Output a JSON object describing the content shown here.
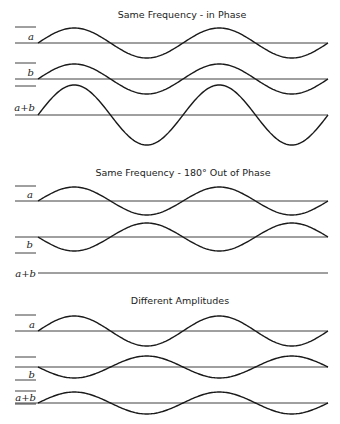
{
  "sections": [
    {
      "title": "Same Frequency - in Phase",
      "rows": [
        {
          "label": "a",
          "baseline": 43,
          "amplitude": 15,
          "phase": 0
        },
        {
          "label": "b",
          "baseline": 79,
          "amplitude": 15,
          "phase": 0
        },
        {
          "label": "a+b",
          "baseline": 115,
          "amplitude": 30,
          "phase": 0
        }
      ]
    },
    {
      "title": "Same Frequency - 180° Out of Phase",
      "rows": [
        {
          "label": "a",
          "baseline": 201,
          "amplitude": 14,
          "phase": 0
        },
        {
          "label": "b",
          "baseline": 237,
          "amplitude": 14,
          "phase": 180
        },
        {
          "label": "a+b",
          "baseline": 273,
          "amplitude": 0,
          "phase": 0
        }
      ]
    },
    {
      "title": "Different Amplitudes",
      "rows": [
        {
          "label": "a",
          "baseline": 331,
          "amplitude": 15,
          "phase": 0
        },
        {
          "label": "b",
          "baseline": 367,
          "amplitude": 11,
          "phase": 180
        },
        {
          "label": "a+b",
          "baseline": 403,
          "amplitude": 11,
          "phase": 0
        }
      ]
    }
  ],
  "wave": {
    "x_start": 38,
    "x_end": 328,
    "periods": 2
  }
}
